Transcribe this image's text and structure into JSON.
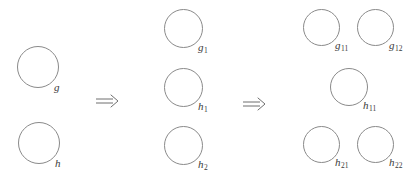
{
  "figure": {
    "background_color": "#ffffff",
    "stroke_color": "#8a8a8a",
    "text_color": "#3a3a3a",
    "stages": [
      {
        "name": "stage-1",
        "nodes": [
          {
            "id": "g",
            "base": "g",
            "sub": "",
            "x": 17,
            "y": 46,
            "d": 42
          },
          {
            "id": "h",
            "base": "h",
            "sub": "",
            "x": 18,
            "y": 122,
            "d": 42
          }
        ]
      },
      {
        "name": "stage-2",
        "nodes": [
          {
            "id": "g1",
            "base": "g",
            "sub": "1",
            "x": 164,
            "y": 9,
            "d": 39
          },
          {
            "id": "h1",
            "base": "h",
            "sub": "1",
            "x": 164,
            "y": 68,
            "d": 39
          },
          {
            "id": "h2",
            "base": "h",
            "sub": "2",
            "x": 164,
            "y": 126,
            "d": 39
          }
        ]
      },
      {
        "name": "stage-3",
        "nodes": [
          {
            "id": "g11",
            "base": "g",
            "sub": "11",
            "x": 303,
            "y": 9,
            "d": 37
          },
          {
            "id": "g12",
            "base": "g",
            "sub": "12",
            "x": 357,
            "y": 9,
            "d": 37
          },
          {
            "id": "h11",
            "base": "h",
            "sub": "11",
            "x": 330,
            "y": 68,
            "d": 38
          },
          {
            "id": "h21",
            "base": "h",
            "sub": "21",
            "x": 303,
            "y": 126,
            "d": 37
          },
          {
            "id": "h22",
            "base": "h",
            "sub": "22",
            "x": 357,
            "y": 126,
            "d": 37
          }
        ]
      }
    ],
    "arrows": [
      {
        "id": "arrow-1",
        "glyph": "⟹",
        "x": 95,
        "y": 93
      },
      {
        "id": "arrow-2",
        "glyph": "⟹",
        "x": 242,
        "y": 96
      }
    ]
  }
}
